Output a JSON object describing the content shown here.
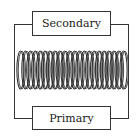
{
  "diagram": {
    "labels": {
      "secondary": "Secondary",
      "primary": "Primary"
    },
    "coil": {
      "turns": 22,
      "color": "#333333"
    }
  }
}
